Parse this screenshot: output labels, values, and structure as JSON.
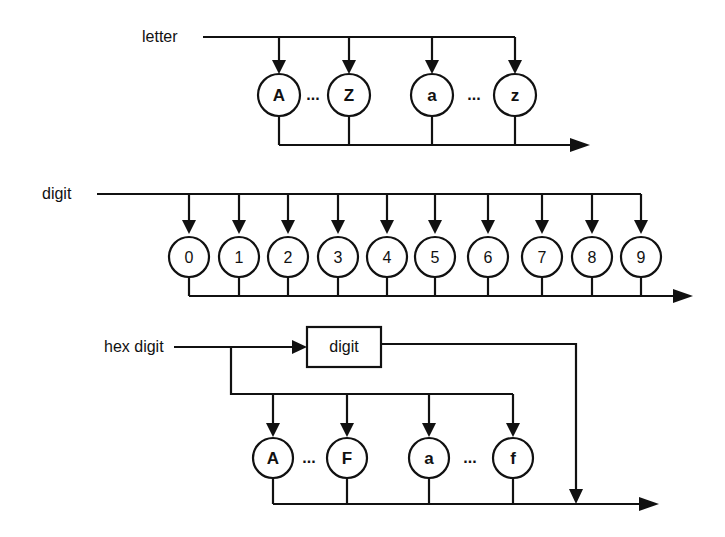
{
  "diagram": {
    "colors": {
      "stroke": "#111111",
      "background": "#ffffff"
    },
    "letter": {
      "label": "letter",
      "nodes": [
        {
          "text": "A",
          "x": 279
        },
        {
          "text": "Z",
          "x": 349
        },
        {
          "text": "a",
          "x": 432
        },
        {
          "text": "z",
          "x": 515
        }
      ],
      "ellipses": [
        {
          "text": "...",
          "x": 313
        },
        {
          "text": "...",
          "x": 474
        }
      ]
    },
    "digit": {
      "label": "digit",
      "nodes": [
        {
          "text": "0",
          "x": 189
        },
        {
          "text": "1",
          "x": 239
        },
        {
          "text": "2",
          "x": 288
        },
        {
          "text": "3",
          "x": 338
        },
        {
          "text": "4",
          "x": 387
        },
        {
          "text": "5",
          "x": 435
        },
        {
          "text": "6",
          "x": 488
        },
        {
          "text": "7",
          "x": 542
        },
        {
          "text": "8",
          "x": 592
        },
        {
          "text": "9",
          "x": 641
        }
      ]
    },
    "hex_digit": {
      "label": "hex digit",
      "box_label": "digit",
      "nodes": [
        {
          "text": "A",
          "x": 273
        },
        {
          "text": "F",
          "x": 347
        },
        {
          "text": "a",
          "x": 429
        },
        {
          "text": "f",
          "x": 513
        }
      ],
      "ellipses": [
        {
          "text": "...",
          "x": 309
        },
        {
          "text": "...",
          "x": 470
        }
      ]
    }
  }
}
